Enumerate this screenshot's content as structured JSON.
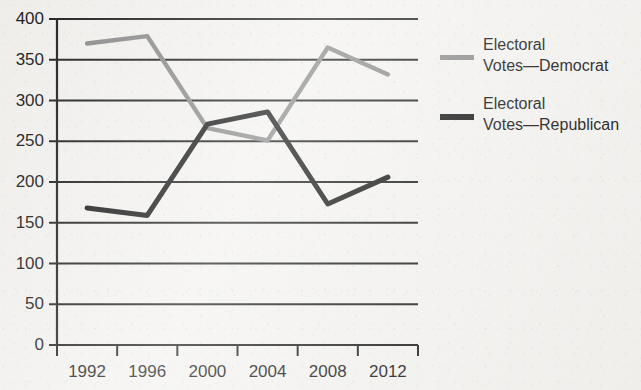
{
  "chart_data": {
    "type": "line",
    "title": "",
    "xlabel": "",
    "ylabel": "",
    "categories": [
      "1992",
      "1996",
      "2000",
      "2004",
      "2008",
      "2012"
    ],
    "x_tick_labels": [
      "1992",
      "1996",
      "2000",
      "2004",
      "2008",
      "2012"
    ],
    "y_tick_labels": [
      "0",
      "50",
      "100",
      "150",
      "200",
      "250",
      "300",
      "350",
      "400"
    ],
    "y_ticks": [
      0,
      50,
      100,
      150,
      200,
      250,
      300,
      350,
      400
    ],
    "ylim": [
      0,
      400
    ],
    "grid": "horizontal",
    "legend_position": "right",
    "series": [
      {
        "name": "Electoral\nVotes—Democrat",
        "color": "#8c8c8c",
        "values": [
          370,
          379,
          266,
          251,
          365,
          332
        ]
      },
      {
        "name": "Electoral\nVotes—Republican",
        "color": "#1a1a1a",
        "values": [
          168,
          159,
          271,
          286,
          173,
          206
        ]
      }
    ]
  },
  "legend": {
    "items": [
      {
        "label": "Electoral\nVotes—Democrat",
        "color": "#8c8c8c"
      },
      {
        "label": "Electoral\nVotes—Republican",
        "color": "#1a1a1a"
      }
    ]
  },
  "axes": {
    "y_labels": [
      "400",
      "350",
      "300",
      "250",
      "200",
      "150",
      "100",
      "50",
      "0"
    ],
    "x_labels": [
      "1992",
      "1996",
      "2000",
      "2004",
      "2008",
      "2012"
    ]
  },
  "colors": {
    "democrat": "#8c8c8c",
    "republican": "#1a1a1a",
    "axis": "#1f1f1f",
    "background": "#f3f2ef"
  }
}
